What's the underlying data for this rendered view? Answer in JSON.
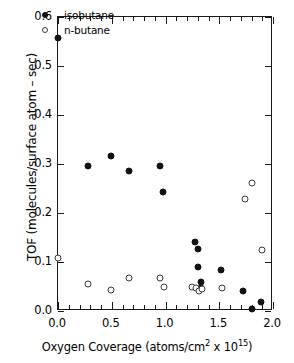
{
  "chart_data": {
    "type": "scatter",
    "title": "",
    "xlabel": "Oxygen Coverage (atoms/cm2 x 1015)",
    "xlabel_parts": {
      "pre": "Oxygen Coverage (atoms/cm",
      "sup1": "2",
      "mid": " x 10",
      "sup2": "15",
      "post": ")"
    },
    "ylabel": "TOF (molecules/surface atom – sec)",
    "xlim": [
      0.0,
      2.0
    ],
    "ylim": [
      0.0,
      0.6
    ],
    "xticks": [
      0.0,
      0.5,
      1.0,
      1.5,
      2.0
    ],
    "xticklabels": [
      "0.0",
      "0.5",
      "1.0",
      "1.5",
      "2.0"
    ],
    "x_minor_step": 0.1,
    "yticks": [
      0.0,
      0.1,
      0.2,
      0.3,
      0.4,
      0.5,
      0.6
    ],
    "yticklabels": [
      "0.0",
      "0.1",
      "0.2",
      "0.3",
      "0.4",
      "0.5",
      "0.6"
    ],
    "grid": false,
    "legend_position": "top-left-inside",
    "marker_color": "#111111",
    "axis_color": "#1a1a1a",
    "series": [
      {
        "name": "isobutane",
        "marker": "filled-circle",
        "points": [
          [
            0.0,
            0.558
          ],
          [
            0.28,
            0.295
          ],
          [
            0.49,
            0.317
          ],
          [
            0.66,
            0.285
          ],
          [
            0.95,
            0.295
          ],
          [
            0.98,
            0.243
          ],
          [
            1.27,
            0.14
          ],
          [
            1.3,
            0.127
          ],
          [
            1.3,
            0.089
          ],
          [
            1.33,
            0.06
          ],
          [
            1.33,
            0.046
          ],
          [
            1.52,
            0.084
          ],
          [
            1.72,
            0.04
          ],
          [
            1.8,
            0.005
          ],
          [
            1.89,
            0.018
          ]
        ]
      },
      {
        "name": "n-butane",
        "marker": "open-circle",
        "points": [
          [
            0.0,
            0.108
          ],
          [
            0.28,
            0.055
          ],
          [
            0.49,
            0.043
          ],
          [
            0.66,
            0.068
          ],
          [
            0.95,
            0.068
          ],
          [
            0.99,
            0.048
          ],
          [
            1.25,
            0.049
          ],
          [
            1.28,
            0.047
          ],
          [
            1.31,
            0.041
          ],
          [
            1.34,
            0.044
          ],
          [
            1.53,
            0.046
          ],
          [
            1.74,
            0.229
          ],
          [
            1.8,
            0.262
          ],
          [
            1.9,
            0.125
          ]
        ]
      }
    ]
  }
}
